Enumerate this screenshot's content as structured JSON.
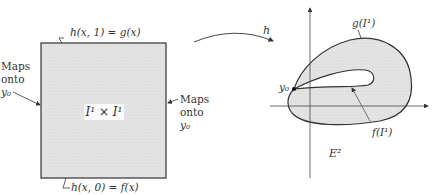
{
  "left_figure": {
    "square_label": "I¹ × I¹",
    "top_label": "h(x, 1) = g(x)",
    "bottom_label": "h(x, 0) = f(x)",
    "left_side_label": [
      "Maps",
      "onto",
      "y₀"
    ],
    "right_side_label": [
      "Maps",
      "onto",
      "y₀"
    ]
  },
  "map_arrow": {
    "label": "h"
  },
  "right_figure": {
    "outer_curve_label": "g(I¹)",
    "inner_curve_label": "f(I¹)",
    "basepoint_label": "y₀",
    "space_label": "E²"
  },
  "colors": {
    "fill": "#e6e6e6",
    "stroke": "#333333"
  }
}
